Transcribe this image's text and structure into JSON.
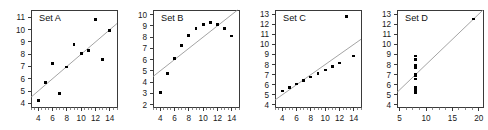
{
  "figure": {
    "marker_color": "#000000",
    "line_color": "#9a9a9a",
    "frame_color": "#3a3a3a",
    "background": "#ffffff"
  },
  "chart_data": [
    {
      "type": "scatter",
      "title": "Set A",
      "xlabel": "",
      "ylabel": "",
      "xlim": [
        3.0,
        15.0
      ],
      "ylim": [
        3.7,
        11.6
      ],
      "xticks": [
        4,
        6,
        8,
        10,
        12,
        14
      ],
      "yticks": [
        4,
        5,
        6,
        7,
        8,
        9,
        10,
        11
      ],
      "grid": false,
      "legend": "none",
      "x": [
        10,
        8,
        13,
        9,
        11,
        14,
        6,
        4,
        12,
        7,
        5
      ],
      "y": [
        8.04,
        6.95,
        7.58,
        8.81,
        8.33,
        9.96,
        7.24,
        4.26,
        10.84,
        4.82,
        5.68
      ],
      "regression": {
        "slope": 0.5,
        "intercept": 3.0
      }
    },
    {
      "type": "scatter",
      "title": "Set B",
      "xlabel": "",
      "ylabel": "",
      "xlim": [
        3.0,
        15.0
      ],
      "ylim": [
        1.8,
        10.4
      ],
      "xticks": [
        4,
        6,
        8,
        10,
        12,
        14
      ],
      "yticks": [
        2,
        3,
        4,
        5,
        6,
        7,
        8,
        9,
        10
      ],
      "grid": false,
      "legend": "none",
      "x": [
        10,
        8,
        13,
        9,
        11,
        14,
        6,
        4,
        12,
        7,
        5
      ],
      "y": [
        9.14,
        8.14,
        8.74,
        8.77,
        9.26,
        8.1,
        6.13,
        3.1,
        9.13,
        7.26,
        4.74
      ],
      "regression": {
        "slope": 0.5,
        "intercept": 3.0
      }
    },
    {
      "type": "scatter",
      "title": "Set C",
      "xlabel": "",
      "ylabel": "",
      "xlim": [
        3.0,
        15.0
      ],
      "ylim": [
        3.8,
        13.4
      ],
      "xticks": [
        4,
        6,
        8,
        10,
        12,
        14
      ],
      "yticks": [
        4,
        5,
        6,
        7,
        8,
        9,
        10,
        11,
        12,
        13
      ],
      "grid": false,
      "legend": "none",
      "x": [
        10,
        8,
        13,
        9,
        11,
        14,
        6,
        4,
        12,
        7,
        5
      ],
      "y": [
        7.46,
        6.77,
        12.74,
        7.11,
        7.81,
        8.84,
        6.08,
        5.39,
        8.15,
        6.42,
        5.73
      ],
      "regression": {
        "slope": 0.5,
        "intercept": 3.0
      }
    },
    {
      "type": "scatter",
      "title": "Set D",
      "xlabel": "",
      "ylabel": "",
      "xlim": [
        4.5,
        20.8
      ],
      "ylim": [
        3.8,
        13.4
      ],
      "xticks": [
        5,
        10,
        15,
        20
      ],
      "yticks": [
        4,
        5,
        6,
        7,
        8,
        9,
        10,
        11,
        12,
        13
      ],
      "grid": false,
      "legend": "none",
      "x": [
        8,
        8,
        8,
        8,
        8,
        8,
        8,
        19,
        8,
        8,
        8
      ],
      "y": [
        6.58,
        5.76,
        7.71,
        8.84,
        8.47,
        7.04,
        5.25,
        12.5,
        5.56,
        7.91,
        6.89
      ],
      "regression": {
        "slope": 0.5,
        "intercept": 3.0
      }
    }
  ]
}
